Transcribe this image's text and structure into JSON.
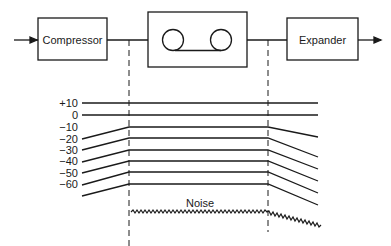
{
  "blocks": {
    "compressor": "Compressor",
    "recorder": "",
    "expander": "Expander"
  },
  "levels": [
    "+10",
    "0",
    "−10",
    "−20",
    "−30",
    "−40",
    "−50",
    "−60"
  ],
  "noise_label": "Noise",
  "colors": {
    "ink": "#1a1a1a",
    "background": "#ffffff"
  }
}
